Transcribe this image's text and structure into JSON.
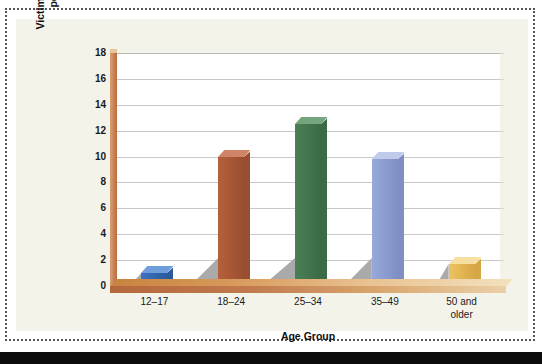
{
  "figure": {
    "panel_background": "#f4f3ea",
    "plot_background": "#ffffff",
    "frame_style": "dotted"
  },
  "chart_data": {
    "type": "bar",
    "title": "",
    "subtitle": "",
    "xlabel": "Age Group",
    "ylabel": "Victimization Rate (number per 1,000 females)",
    "ylabel_line1": "Victimization Rate (number",
    "ylabel_line2": "per 1,000 females)",
    "categories": [
      "12–17",
      "18–24",
      "25–34",
      "35–49",
      "50 and older"
    ],
    "category_lines": [
      [
        "12–17"
      ],
      [
        "18–24"
      ],
      [
        "25–34"
      ],
      [
        "35–49"
      ],
      [
        "50 and",
        "older"
      ]
    ],
    "values": [
      1.0,
      10.0,
      12.5,
      9.8,
      1.7
    ],
    "ylim": [
      0,
      18
    ],
    "yticks": [
      0,
      2,
      4,
      6,
      8,
      10,
      12,
      14,
      16,
      18
    ],
    "ytick_labels": [
      "0",
      "2",
      "4",
      "6",
      "8",
      "10",
      "12",
      "14",
      "16",
      "18"
    ],
    "grid": true,
    "grid_axis": "y",
    "legend": false,
    "bar_colors": [
      "#3b72bf",
      "#b5603c",
      "#4a8055",
      "#97a8db",
      "#edc25f"
    ],
    "bar_top_colors": [
      "#6f9ddb",
      "#cf8467",
      "#74a57d",
      "#c0cbeb",
      "#f7dfa2"
    ],
    "bar_side_colors": [
      "#2b5a9c",
      "#9a4e31",
      "#3b6a46",
      "#7f8fc4",
      "#d6a845"
    ],
    "style": "3d-column"
  }
}
